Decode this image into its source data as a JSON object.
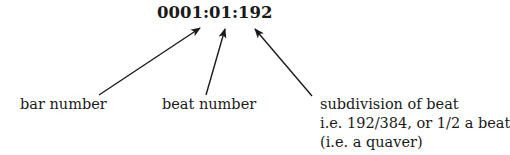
{
  "timecode": "0001:01:192",
  "labels": {
    "bar": "bar number",
    "beat": "beat number",
    "subdivision": {
      "lines": [
        "subdivision of beat",
        "i.e. 192/384, or 1/2 a beat",
        "(i.e. a quaver)"
      ]
    }
  },
  "arrows": [
    {
      "name": "bar",
      "from": [
        99,
        95
      ],
      "to": [
        200,
        28
      ]
    },
    {
      "name": "beat",
      "from": [
        206,
        95
      ],
      "to": [
        225,
        29
      ]
    },
    {
      "name": "subdivision",
      "from": [
        312,
        96
      ],
      "to": [
        255,
        29
      ]
    }
  ],
  "colors": {
    "ink": "#1a1a1a",
    "background": "#ffffff"
  }
}
